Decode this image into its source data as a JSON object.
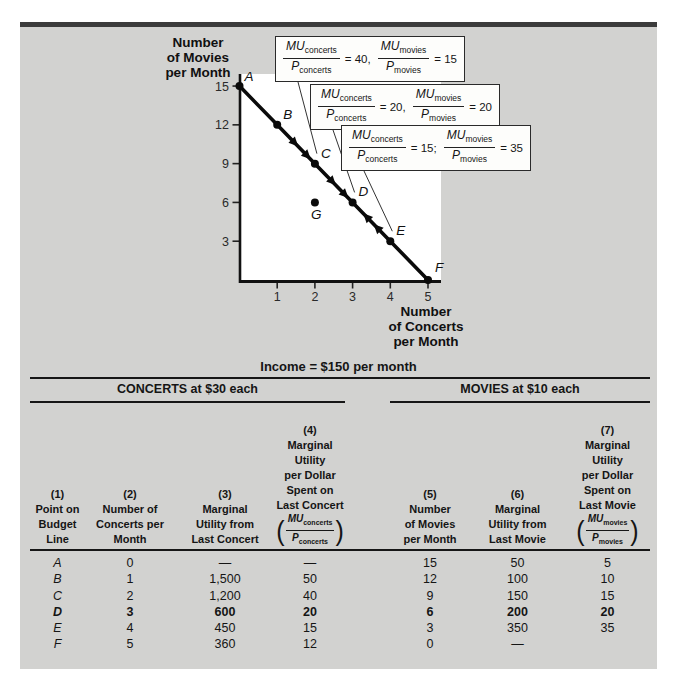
{
  "figure": {
    "y_axis_title_lines": [
      "Number",
      "of Movies",
      "per Month"
    ],
    "x_axis_title_lines": [
      "Number",
      "of Concerts",
      "per Month"
    ]
  },
  "chart_data": {
    "type": "line",
    "title": "",
    "xlabel": "Number of Concerts per Month",
    "ylabel": "Number of Movies per Month",
    "xlim": [
      0,
      5.3
    ],
    "ylim": [
      0,
      16
    ],
    "xticks": [
      1,
      2,
      3,
      4,
      5
    ],
    "yticks": [
      3,
      6,
      9,
      12,
      15
    ],
    "grid": false,
    "series": [
      {
        "name": "budget-line",
        "color": "#0a0a0a",
        "points": [
          {
            "label": "A",
            "x": 0,
            "y": 15
          },
          {
            "label": "B",
            "x": 1,
            "y": 12
          },
          {
            "label": "C",
            "x": 2,
            "y": 9
          },
          {
            "label": "D",
            "x": 3,
            "y": 6
          },
          {
            "label": "E",
            "x": 4,
            "y": 3
          },
          {
            "label": "F",
            "x": 5,
            "y": 0
          }
        ]
      }
    ],
    "isolated_points": [
      {
        "label": "G",
        "x": 2,
        "y": 6
      }
    ],
    "arrows": [
      {
        "from": "B",
        "to": "C",
        "positions": [
          0.42,
          0.75
        ]
      },
      {
        "from": "C",
        "to": "D",
        "positions": [
          0.42,
          0.75
        ]
      },
      {
        "from": "E",
        "to": "D",
        "positions": [
          0.3,
          0.58
        ]
      }
    ],
    "ratio_labels": {
      "mu": "MU",
      "p": "P",
      "concerts": "concerts",
      "movies": "movies"
    },
    "annotations": [
      {
        "concerts_ratio": "40",
        "sep": ",",
        "movies_ratio": "15",
        "target_point": "C"
      },
      {
        "concerts_ratio": "20",
        "sep": ",",
        "movies_ratio": "20",
        "target_point": "D"
      },
      {
        "concerts_ratio": "15",
        "sep": ";",
        "movies_ratio": "35",
        "target_point": "E"
      }
    ]
  },
  "table": {
    "income_note": "Income = $150 per month",
    "group_left": "CONCERTS at $30 each",
    "group_right": "MOVIES at $10 each",
    "columns": [
      {
        "num": "(1)",
        "lines": [
          "Point on",
          "Budget",
          "Line"
        ]
      },
      {
        "num": "(2)",
        "lines": [
          "Number of",
          "Concerts per",
          "Month"
        ]
      },
      {
        "num": "(3)",
        "lines": [
          "Marginal",
          "Utility from",
          "Last Concert"
        ]
      },
      {
        "num": "(4)",
        "lines": [
          "Marginal",
          "Utility",
          "per Dollar",
          "Spent on",
          "Last Concert"
        ],
        "fraction": {
          "num": "MU",
          "num_sub": "concerts",
          "den": "P",
          "den_sub": "concerts"
        }
      },
      {
        "num": "(5)",
        "lines": [
          "Number",
          "of Movies",
          "per Month"
        ]
      },
      {
        "num": "(6)",
        "lines": [
          "Marginal",
          "Utility from",
          "Last Movie"
        ]
      },
      {
        "num": "(7)",
        "lines": [
          "Marginal",
          "Utility",
          "per Dollar",
          "Spent on",
          "Last Movie"
        ],
        "fraction": {
          "num": "MU",
          "num_sub": "movies",
          "den": "P",
          "den_sub": "movies"
        }
      }
    ],
    "rows": [
      {
        "cells": [
          "A",
          "0",
          "—",
          "—",
          "15",
          "50",
          "5"
        ],
        "bold": false
      },
      {
        "cells": [
          "B",
          "1",
          "1,500",
          "50",
          "12",
          "100",
          "10"
        ],
        "bold": false
      },
      {
        "cells": [
          "C",
          "2",
          "1,200",
          "40",
          "9",
          "150",
          "15"
        ],
        "bold": false
      },
      {
        "cells": [
          "D",
          "3",
          "600",
          "20",
          "6",
          "200",
          "20"
        ],
        "bold": true
      },
      {
        "cells": [
          "E",
          "4",
          "450",
          "15",
          "3",
          "350",
          "35"
        ],
        "bold": false
      },
      {
        "cells": [
          "F",
          "5",
          "360",
          "12",
          "0",
          "—",
          ""
        ],
        "bold": false
      }
    ]
  },
  "colors": {
    "panel_bg": "#d2d2d0",
    "top_bar": "#3b3b3b",
    "line": "#0a0a0a",
    "rule": "#161616",
    "plot_bg": "#ffffff"
  }
}
